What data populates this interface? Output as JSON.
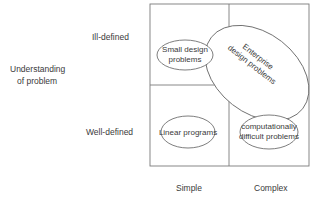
{
  "y_axis": {
    "title_line1": "Understanding",
    "title_line2": "of problem",
    "top": "Ill-defined",
    "bottom": "Well-defined"
  },
  "x_axis": {
    "left": "Simple",
    "right": "Complex"
  },
  "ellipses": {
    "small_design": [
      "Small design",
      "problems"
    ],
    "enterprise": [
      "Enterprise",
      "design problems"
    ],
    "linear": "Linear programs",
    "computational": [
      "computationally",
      "difficult problems"
    ]
  },
  "colors": {
    "line": "#7a7a7a",
    "text": "#3a3a3a",
    "background": "#ffffff"
  }
}
